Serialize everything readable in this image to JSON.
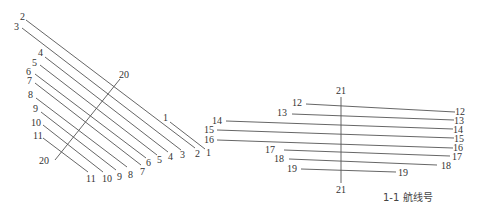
{
  "caption": "1-1 航线号",
  "colors": {
    "line": "#555555",
    "text": "#333333",
    "background": "#ffffff"
  },
  "left_group": {
    "lines": [
      {
        "id": "2",
        "x1": 26,
        "y1": 20,
        "x2": 195,
        "y2": 148,
        "start_label": "2",
        "end_label": "2",
        "sx": 20,
        "sy": 20,
        "ex": 195,
        "ey": 157
      },
      {
        "id": "3",
        "x1": 22,
        "y1": 28,
        "x2": 181,
        "y2": 150,
        "start_label": "3",
        "end_label": "3",
        "sx": 14,
        "sy": 30,
        "ex": 180,
        "ey": 158
      },
      {
        "id": "4",
        "x1": 45,
        "y1": 57,
        "x2": 168,
        "y2": 152,
        "start_label": "4",
        "end_label": "4",
        "sx": 38,
        "sy": 56,
        "ex": 168,
        "ey": 160
      },
      {
        "id": "5",
        "x1": 40,
        "y1": 65,
        "x2": 157,
        "y2": 155,
        "start_label": "5",
        "end_label": "5",
        "sx": 32,
        "sy": 66,
        "ex": 157,
        "ey": 163
      },
      {
        "id": "6",
        "x1": 35,
        "y1": 74,
        "x2": 146,
        "y2": 158,
        "start_label": "6",
        "end_label": "6",
        "sx": 26,
        "sy": 75,
        "ex": 146,
        "ey": 166
      },
      {
        "id": "7",
        "x1": 35,
        "y1": 83,
        "x2": 141,
        "y2": 165,
        "start_label": "7",
        "end_label": "7",
        "sx": 27,
        "sy": 84,
        "ex": 140,
        "ey": 175
      },
      {
        "id": "8",
        "x1": 36,
        "y1": 98,
        "x2": 127,
        "y2": 167,
        "start_label": "8",
        "end_label": "8",
        "sx": 28,
        "sy": 98,
        "ex": 128,
        "ey": 178
      },
      {
        "id": "9",
        "x1": 41,
        "y1": 112,
        "x2": 116,
        "y2": 170,
        "start_label": "9",
        "end_label": "9",
        "sx": 33,
        "sy": 112,
        "ex": 117,
        "ey": 180
      },
      {
        "id": "10",
        "x1": 43,
        "y1": 125,
        "x2": 103,
        "y2": 172,
        "start_label": "10",
        "end_label": "10",
        "sx": 31,
        "sy": 126,
        "ex": 102,
        "ey": 182
      },
      {
        "id": "11",
        "x1": 43,
        "y1": 138,
        "x2": 88,
        "y2": 172,
        "start_label": "11",
        "end_label": "11",
        "sx": 33,
        "sy": 139,
        "ex": 86,
        "ey": 182
      },
      {
        "id": "1",
        "x1": 170,
        "y1": 122,
        "x2": 205,
        "y2": 149,
        "start_label": "1",
        "end_label": "1",
        "sx": 163,
        "sy": 121,
        "ex": 206,
        "ey": 156
      },
      {
        "id": "20",
        "x1": 55,
        "y1": 160,
        "x2": 120,
        "y2": 79,
        "start_label": "20",
        "end_label": "20",
        "sx": 39,
        "sy": 164,
        "ex": 119,
        "ey": 78
      }
    ]
  },
  "right_group": {
    "lines": [
      {
        "id": "12",
        "x1": 306,
        "y1": 104,
        "x2": 455,
        "y2": 112,
        "start_label": "12",
        "end_label": "12",
        "sx": 292,
        "sy": 106,
        "ex": 455,
        "ey": 115
      },
      {
        "id": "13",
        "x1": 292,
        "y1": 114,
        "x2": 454,
        "y2": 120,
        "start_label": "13",
        "end_label": "13",
        "sx": 277,
        "sy": 116,
        "ex": 454,
        "ey": 124
      },
      {
        "id": "14",
        "x1": 226,
        "y1": 121,
        "x2": 453,
        "y2": 129,
        "start_label": "14",
        "end_label": "14",
        "sx": 212,
        "sy": 124,
        "ex": 453,
        "ey": 133
      },
      {
        "id": "15",
        "x1": 217,
        "y1": 130,
        "x2": 454,
        "y2": 138,
        "start_label": "15",
        "end_label": "15",
        "sx": 204,
        "sy": 133,
        "ex": 454,
        "ey": 142
      },
      {
        "id": "16",
        "x1": 217,
        "y1": 140,
        "x2": 453,
        "y2": 148,
        "start_label": "16",
        "end_label": "16",
        "sx": 204,
        "sy": 143,
        "ex": 453,
        "ey": 151
      },
      {
        "id": "17",
        "x1": 284,
        "y1": 150,
        "x2": 450,
        "y2": 156,
        "start_label": "17",
        "end_label": "17",
        "sx": 265,
        "sy": 153,
        "ex": 452,
        "ey": 160
      },
      {
        "id": "18",
        "x1": 289,
        "y1": 159,
        "x2": 437,
        "y2": 165,
        "start_label": "18",
        "end_label": "18",
        "sx": 274,
        "sy": 162,
        "ex": 441,
        "ey": 169
      },
      {
        "id": "19",
        "x1": 301,
        "y1": 169,
        "x2": 396,
        "y2": 172,
        "start_label": "19",
        "end_label": "19",
        "sx": 287,
        "sy": 172,
        "ex": 398,
        "ey": 176
      },
      {
        "id": "21",
        "x1": 341,
        "y1": 97,
        "x2": 341,
        "y2": 183,
        "start_label": "21",
        "end_label": "21",
        "sx": 336,
        "sy": 94,
        "ex": 336,
        "ey": 193
      }
    ]
  },
  "caption_pos": {
    "x": 383,
    "y": 201
  }
}
